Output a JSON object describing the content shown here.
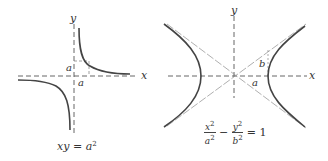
{
  "figures": [
    {
      "id": "rectangular-hyperbola",
      "axis_labels": {
        "x": "x",
        "y": "y"
      },
      "marks": {
        "x_mark": "a",
        "y_mark": "a"
      },
      "caption": {
        "lhs": "xy",
        "eq": "=",
        "rhs": "a",
        "exp": "2"
      }
    },
    {
      "id": "standard-hyperbola",
      "axis_labels": {
        "x": "x",
        "y": "y"
      },
      "marks": {
        "a": "a",
        "b": "b"
      },
      "caption": {
        "term1_num": "x",
        "term1_num_exp": "2",
        "term1_den": "a",
        "term1_den_exp": "2",
        "minus": "−",
        "term2_num": "y",
        "term2_num_exp": "2",
        "term2_den": "b",
        "term2_den_exp": "2",
        "eq": "=",
        "rhs": "1"
      }
    }
  ],
  "colors": {
    "curve": "#444444",
    "axis": "#555555",
    "asymptote": "#9a9a9a"
  }
}
